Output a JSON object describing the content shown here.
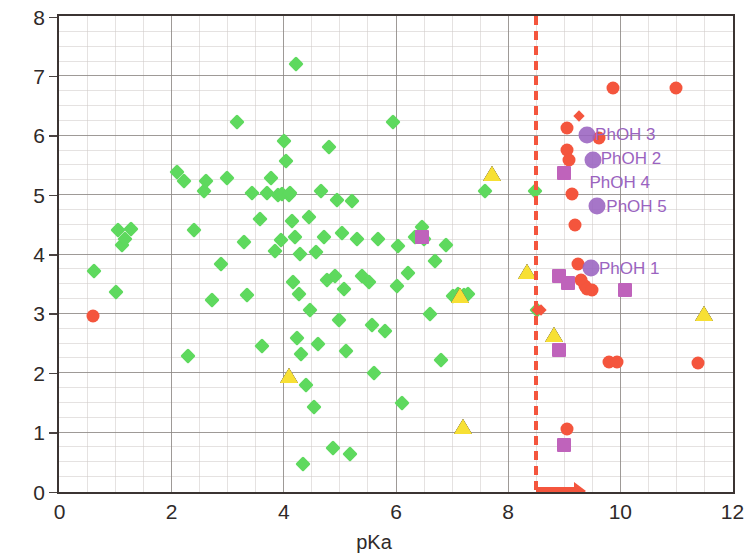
{
  "chart_data": {
    "type": "scatter",
    "title": "",
    "xlabel": "pKa",
    "ylabel": "ClogP",
    "xlim": [
      0,
      12
    ],
    "ylim": [
      0,
      8
    ],
    "xticks": [
      0,
      2,
      4,
      6,
      8,
      10,
      12
    ],
    "yticks": [
      0,
      1,
      2,
      3,
      4,
      5,
      6,
      7,
      8
    ],
    "grid": true,
    "legend_position": "none",
    "colors": {
      "green_diamond": "#5ed95e",
      "red_circle": "#f4553d",
      "purple_circle": "#9a63c0",
      "magenta_square": "#bf63bb",
      "yellow_triangle": "#f7e034",
      "threshold": "#f4553d",
      "axis": "#3b3432",
      "gridline": "#8d8885",
      "label_text": "#9a63c0"
    },
    "annotations": {
      "threshold_line": {
        "x": 8.5,
        "style": "dashed",
        "color": "#f4553d"
      },
      "threshold_arrow": {
        "from_x": 8.5,
        "to_x": 9.2,
        "y": 0,
        "direction": "right",
        "color": "#f4553d"
      }
    },
    "point_labels": [
      {
        "text": "PhOH 3",
        "x": 9.55,
        "y": 6.0
      },
      {
        "text": "PhOH 2",
        "x": 9.65,
        "y": 5.6
      },
      {
        "text": "PhOH 4",
        "x": 9.45,
        "y": 5.2
      },
      {
        "text": "PhOH 5",
        "x": 9.75,
        "y": 4.8
      },
      {
        "text": "PhOH 1",
        "x": 9.62,
        "y": 3.75
      }
    ],
    "series": [
      {
        "name": "green diamonds",
        "marker": "diamond",
        "color": "#5ed95e",
        "points": [
          [
            0.62,
            3.7
          ],
          [
            1.05,
            4.4
          ],
          [
            1.12,
            4.15
          ],
          [
            1.18,
            4.25
          ],
          [
            1.28,
            4.42
          ],
          [
            1.02,
            3.35
          ],
          [
            2.1,
            5.38
          ],
          [
            2.22,
            5.22
          ],
          [
            2.3,
            2.28
          ],
          [
            2.4,
            4.4
          ],
          [
            2.58,
            5.05
          ],
          [
            2.62,
            5.22
          ],
          [
            2.72,
            3.22
          ],
          [
            3.0,
            5.28
          ],
          [
            3.18,
            6.22
          ],
          [
            3.3,
            4.2
          ],
          [
            3.35,
            3.3
          ],
          [
            3.45,
            5.02
          ],
          [
            3.58,
            4.58
          ],
          [
            3.7,
            5.02
          ],
          [
            3.78,
            5.28
          ],
          [
            3.85,
            4.05
          ],
          [
            3.9,
            4.98
          ],
          [
            3.95,
            4.22
          ],
          [
            3.98,
            5.0
          ],
          [
            4.02,
            5.9
          ],
          [
            4.05,
            5.55
          ],
          [
            4.1,
            4.98
          ],
          [
            4.12,
            5.02
          ],
          [
            4.15,
            4.55
          ],
          [
            4.18,
            3.52
          ],
          [
            4.2,
            4.28
          ],
          [
            4.22,
            7.2
          ],
          [
            4.25,
            2.58
          ],
          [
            4.28,
            3.32
          ],
          [
            4.3,
            4.0
          ],
          [
            4.32,
            2.3
          ],
          [
            4.35,
            0.45
          ],
          [
            4.4,
            1.78
          ],
          [
            4.48,
            3.05
          ],
          [
            4.55,
            1.42
          ],
          [
            4.62,
            2.48
          ],
          [
            4.68,
            5.05
          ],
          [
            4.72,
            4.28
          ],
          [
            4.78,
            3.55
          ],
          [
            4.82,
            5.8
          ],
          [
            4.88,
            0.72
          ],
          [
            4.92,
            3.62
          ],
          [
            4.95,
            4.9
          ],
          [
            5.0,
            2.88
          ],
          [
            5.05,
            4.35
          ],
          [
            5.12,
            2.35
          ],
          [
            5.18,
            0.62
          ],
          [
            5.22,
            4.88
          ],
          [
            5.32,
            4.25
          ],
          [
            5.4,
            3.62
          ],
          [
            5.52,
            3.52
          ],
          [
            5.58,
            2.8
          ],
          [
            5.62,
            1.98
          ],
          [
            5.68,
            4.25
          ],
          [
            5.82,
            2.7
          ],
          [
            5.95,
            6.22
          ],
          [
            6.02,
            3.45
          ],
          [
            6.05,
            4.12
          ],
          [
            6.12,
            1.48
          ],
          [
            6.22,
            3.68
          ],
          [
            6.35,
            4.28
          ],
          [
            6.48,
            4.45
          ],
          [
            6.5,
            4.25
          ],
          [
            6.62,
            2.98
          ],
          [
            6.7,
            3.88
          ],
          [
            6.82,
            2.2
          ],
          [
            6.9,
            4.15
          ],
          [
            7.02,
            3.28
          ],
          [
            7.12,
            3.32
          ],
          [
            7.22,
            3.3
          ],
          [
            7.3,
            3.32
          ],
          [
            7.6,
            5.05
          ],
          [
            8.48,
            5.05
          ],
          [
            8.52,
            3.05
          ],
          [
            4.45,
            4.62
          ],
          [
            3.62,
            2.45
          ],
          [
            5.08,
            3.4
          ],
          [
            2.88,
            3.82
          ],
          [
            4.58,
            4.02
          ]
        ]
      },
      {
        "name": "red circles",
        "marker": "circle",
        "color": "#f4553d",
        "points": [
          [
            0.6,
            2.95
          ],
          [
            9.05,
            6.12
          ],
          [
            9.05,
            5.75
          ],
          [
            9.1,
            5.58
          ],
          [
            9.15,
            5.0
          ],
          [
            9.2,
            4.48
          ],
          [
            9.25,
            3.82
          ],
          [
            9.3,
            3.55
          ],
          [
            9.38,
            3.45
          ],
          [
            9.42,
            3.4
          ],
          [
            9.5,
            3.38
          ],
          [
            9.88,
            6.78
          ],
          [
            9.62,
            5.95
          ],
          [
            9.8,
            2.18
          ],
          [
            11.0,
            6.78
          ],
          [
            9.05,
            1.05
          ],
          [
            11.4,
            2.15
          ],
          [
            9.95,
            2.18
          ]
        ]
      },
      {
        "name": "red small diamonds",
        "marker": "small-diamond",
        "color": "#f4553d",
        "points": [
          [
            9.28,
            6.32
          ],
          [
            8.52,
            3.05
          ],
          [
            8.6,
            3.05
          ]
        ]
      },
      {
        "name": "purple circles",
        "marker": "circle-purple",
        "color": "#9a63c0",
        "points": [
          [
            9.42,
            6.0
          ],
          [
            9.52,
            5.58
          ],
          [
            9.6,
            4.8
          ],
          [
            9.48,
            3.75
          ]
        ]
      },
      {
        "name": "magenta squares",
        "marker": "square",
        "color": "#bf63bb",
        "points": [
          [
            6.48,
            4.28
          ],
          [
            9.0,
            5.35
          ],
          [
            8.92,
            3.62
          ],
          [
            9.08,
            3.5
          ],
          [
            8.92,
            2.38
          ],
          [
            9.0,
            0.78
          ],
          [
            10.1,
            3.38
          ]
        ]
      },
      {
        "name": "yellow triangles",
        "marker": "triangle",
        "color": "#f7e034",
        "points": [
          [
            4.1,
            1.95
          ],
          [
            7.2,
            1.1
          ],
          [
            7.15,
            3.3
          ],
          [
            7.72,
            5.35
          ],
          [
            8.35,
            3.7
          ],
          [
            8.82,
            2.65
          ],
          [
            11.5,
            3.0
          ]
        ]
      }
    ]
  }
}
